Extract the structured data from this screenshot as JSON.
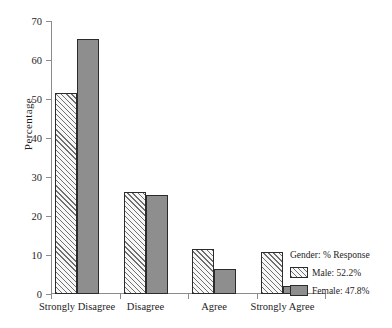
{
  "chart_data": {
    "type": "bar",
    "title": "",
    "xlabel": "",
    "ylabel": "Percentage",
    "ylim": [
      0,
      70
    ],
    "yticks": [
      0,
      10,
      20,
      30,
      40,
      50,
      60,
      70
    ],
    "ytick_labels": [
      "0",
      "10",
      "20",
      "30",
      "40",
      "50",
      "60",
      "70"
    ],
    "grid": false,
    "legend_position": "right-bottom",
    "legend_title": "Gender: % Response",
    "categories": [
      "Strongly Disagree",
      "Disagree",
      "Agree",
      "Strongly Agree"
    ],
    "series": [
      {
        "name": "Male: 52.2%",
        "short_name": "Male",
        "values": [
          51.6,
          26.2,
          11.5,
          10.9
        ],
        "fill": "hatched-diagonal",
        "color": "#f7f7f7",
        "hatch_color": "#6f6f6f",
        "border_color": "#2b2b2b"
      },
      {
        "name": "Female: 47.8%",
        "short_name": "Female",
        "values": [
          65.5,
          25.4,
          6.3,
          2.1
        ],
        "fill": "solid",
        "color": "#8e8e8e",
        "border_color": "#2b2b2b"
      }
    ]
  },
  "axis": {
    "line_color": "#8c8c8c",
    "text_color": "#1d1d1d"
  },
  "legend": {
    "title": "Gender: % Response",
    "items": [
      {
        "label": "Male: 52.2%",
        "swatch": "male"
      },
      {
        "label": "Female: 47.8%",
        "swatch": "female"
      }
    ]
  }
}
